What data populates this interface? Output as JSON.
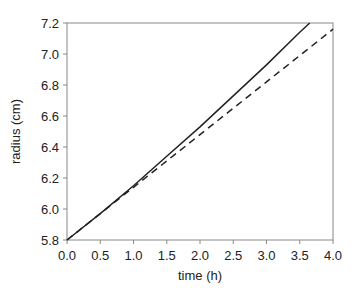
{
  "chart_data": {
    "type": "line",
    "title": "",
    "xlabel": "time (h)",
    "ylabel": "radius (cm)",
    "xlim": [
      0.0,
      4.0
    ],
    "ylim": [
      5.8,
      7.2
    ],
    "xticks": [
      "0.0",
      "0.5",
      "1.0",
      "1.5",
      "2.0",
      "2.5",
      "3.0",
      "3.5",
      "4.0"
    ],
    "yticks": [
      "5.8",
      "6.0",
      "6.2",
      "6.4",
      "6.6",
      "6.8",
      "7.0",
      "7.2"
    ],
    "grid": false,
    "legend": null,
    "series": [
      {
        "name": "solid",
        "style": "solid",
        "color": "#222222",
        "x": [
          0.0,
          0.5,
          1.0,
          1.5,
          2.0,
          2.5,
          3.0,
          3.5,
          3.65
        ],
        "y": [
          5.8,
          5.97,
          6.15,
          6.34,
          6.53,
          6.73,
          6.93,
          7.14,
          7.2
        ]
      },
      {
        "name": "dashed",
        "style": "dashed",
        "color": "#222222",
        "x": [
          0.0,
          0.5,
          1.0,
          1.5,
          2.0,
          2.5,
          3.0,
          3.5,
          4.0
        ],
        "y": [
          5.8,
          5.97,
          6.14,
          6.31,
          6.48,
          6.65,
          6.82,
          6.99,
          7.16
        ]
      }
    ]
  }
}
